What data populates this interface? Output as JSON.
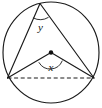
{
  "figure": {
    "background_color": "#ffffff",
    "stroke_color": "#1a1a1a",
    "label_color": "#111111",
    "circle": {
      "name": "circumscribed-circle",
      "center_x": 51,
      "center_y": 52.5,
      "radius_x": 48,
      "radius_y": 50.5
    },
    "center_point": {
      "name": "circle-center-dot",
      "x": 51,
      "y": 52.5,
      "radius": 2.2
    },
    "vertices": {
      "apex": {
        "label": "apex",
        "x": 40,
        "y": 3.5
      },
      "left": {
        "label": "left",
        "x": 7.5,
        "y": 78
      },
      "right": {
        "label": "right",
        "x": 94,
        "y": 78
      }
    },
    "segments": [
      {
        "name": "apex-to-left-chord",
        "x1": 40,
        "y1": 3.5,
        "x2": 7.5,
        "y2": 78
      },
      {
        "name": "apex-to-right-chord",
        "x1": 40,
        "y1": 3.5,
        "x2": 94,
        "y2": 78
      },
      {
        "name": "center-to-left-radius",
        "x1": 51,
        "y1": 52.5,
        "x2": 7.5,
        "y2": 78
      },
      {
        "name": "center-to-right-radius",
        "x1": 51,
        "y1": 52.5,
        "x2": 94,
        "y2": 78
      }
    ],
    "dashed_chord": {
      "name": "base-chord-dashed",
      "x1": 7.5,
      "y1": 78,
      "x2": 94,
      "y2": 78,
      "style": "dashed"
    },
    "angle_arcs": {
      "central": {
        "name": "central-angle-arc",
        "path": "M 39.0 62.6 A 13 13 0 0 0 62.2 61.0",
        "vertex": "center"
      },
      "inscribed": {
        "name": "inscribed-angle-arc",
        "path": "M 33.3 18.0 A 15.5 15.5 0 0 0 48.2 17.5",
        "vertex": "apex"
      }
    },
    "labels": {
      "central_angle": {
        "text": "x",
        "x": 51,
        "y": 68.5
      },
      "inscribed_angle": {
        "text": "y",
        "x": 40.5,
        "y": 28
      }
    }
  }
}
